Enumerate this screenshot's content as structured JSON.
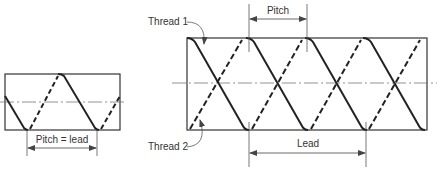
{
  "figure": {
    "single_start": {
      "dimension_label": "Pitch = lead"
    },
    "double_start": {
      "thread1_label": "Thread 1",
      "thread2_label": "Thread 2",
      "pitch_label": "Pitch",
      "lead_label": "Lead"
    },
    "colors": {
      "line": "#222222",
      "thin": "#555555",
      "background": "#ffffff"
    }
  }
}
